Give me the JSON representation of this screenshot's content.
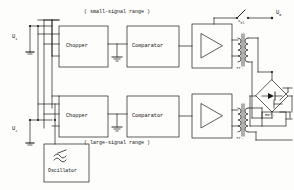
{
  "diagram": {
    "line_color": "#1a1a1a",
    "background": "#fdfdfb"
  },
  "inputs": {
    "u1": {
      "symbol": "U",
      "subscript": "1"
    },
    "u2": {
      "symbol": "U",
      "subscript": "2"
    }
  },
  "ranges": {
    "small": "( small-signal range )",
    "large": "( large-signal range )"
  },
  "blocks": {
    "chopper_top": "Chopper",
    "comparator_top": "Comparator",
    "chopper_bottom": "Chopper",
    "comparator_bottom": "Comparator",
    "oscillator": "Oscillator"
  },
  "transformers": {
    "top": "Tr.",
    "bottom": "Tr."
  },
  "relay": {
    "coil": "Rel.",
    "contact_label": ""
  },
  "switch": {
    "label": "S",
    "subscript": "el"
  },
  "output": {
    "symbol": "U",
    "subscript": "B"
  },
  "icons": {
    "amplifier_top": "amplifier-triangle-icon",
    "amplifier_bottom": "amplifier-triangle-icon",
    "oscillator_wave": "sine-wave-icon",
    "bridge": "diode-bridge-icon",
    "ground_top": "ground-icon",
    "ground_bottom": "ground-icon"
  }
}
